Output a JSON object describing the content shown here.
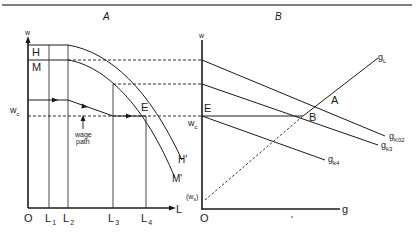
{
  "panels": {
    "left": {
      "title": "A",
      "axis_y_label": "w",
      "axis_x_label": "L",
      "origin_label": "O",
      "x_ticks": [
        {
          "main": "L",
          "sub": "1"
        },
        {
          "main": "L",
          "sub": "2"
        },
        {
          "main": "L",
          "sub": "3"
        },
        {
          "main": "L",
          "sub": "4"
        }
      ],
      "y_labels": {
        "H": "H",
        "M": "M",
        "wc_main": "w",
        "wc_sub": "c"
      },
      "curves": {
        "H_end": "H'",
        "M_end": "M'"
      },
      "point_E": "E",
      "wage_path_line1": "wage",
      "wage_path_line2": "path"
    },
    "right": {
      "title": "B",
      "axis_y_label": "w",
      "axis_x_label": "g",
      "origin_label": "O",
      "ws_open": "(w",
      "ws_sub": "s",
      "ws_close": ")",
      "wc_main": "w",
      "wc_sub": "c",
      "point_E": "E",
      "point_A": "A",
      "point_B": "B",
      "lines": {
        "gL_main": "g",
        "gL_sub": "L",
        "gk02_main": "g",
        "gk02_sub": "K02",
        "gk3_main": "g",
        "gk3_sub": "k3",
        "gk4_main": "g",
        "gk4_sub": "k4"
      }
    }
  }
}
